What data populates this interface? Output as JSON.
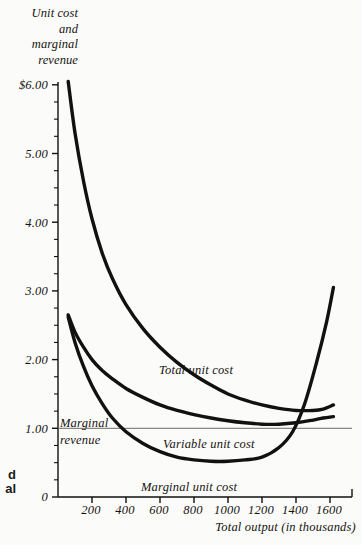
{
  "figure": {
    "y_axis_title": [
      "Unit cost",
      "and",
      "marginal",
      "revenue"
    ],
    "x_axis_title": "Total output (in thousands)",
    "edge_fragment": [
      "d",
      "al"
    ]
  },
  "axes": {
    "y_ticks": [
      "$6.00",
      "5.00",
      "4.00",
      "3.00",
      "2.00",
      "1.00",
      "0"
    ],
    "y_tick_values": [
      6,
      5,
      4,
      3,
      2,
      1,
      0
    ],
    "x_ticks": [
      "200",
      "400",
      "600",
      "800",
      "1000",
      "1200",
      "1400",
      "1600"
    ],
    "x_tick_values": [
      200,
      400,
      600,
      800,
      1000,
      1200,
      1400,
      1600
    ]
  },
  "annotations": {
    "total_unit_cost": "Total unit cost",
    "variable_unit_cost": "Variable unit cost",
    "marginal_unit_cost": "Marginal unit cost",
    "marginal_revenue_line1": "Marginal",
    "marginal_revenue_line2": "revenue"
  },
  "colors": {
    "background": "#fbfbfa",
    "curve": "#111111",
    "axis": "#111111",
    "marginal_revenue_line": "#6e6c66"
  },
  "chart_data": {
    "type": "line",
    "title": "",
    "xlabel": "Total output (in thousands)",
    "ylabel": "Unit cost and marginal revenue",
    "xlim": [
      0,
      1720
    ],
    "ylim": [
      0,
      6.25
    ],
    "grid": false,
    "legend": "inline-labels",
    "x_tick_step": 200,
    "y_tick_step": 1,
    "y_minor_tick_step": 0.25,
    "series": [
      {
        "name": "Total unit cost",
        "label_position": "inline",
        "points": [
          [
            60,
            6.05
          ],
          [
            100,
            5.3
          ],
          [
            150,
            4.6
          ],
          [
            200,
            4.05
          ],
          [
            260,
            3.55
          ],
          [
            320,
            3.18
          ],
          [
            400,
            2.8
          ],
          [
            500,
            2.45
          ],
          [
            600,
            2.18
          ],
          [
            700,
            1.96
          ],
          [
            800,
            1.78
          ],
          [
            900,
            1.63
          ],
          [
            1000,
            1.5
          ],
          [
            1100,
            1.41
          ],
          [
            1200,
            1.34
          ],
          [
            1300,
            1.29
          ],
          [
            1400,
            1.26
          ],
          [
            1500,
            1.26
          ],
          [
            1560,
            1.28
          ],
          [
            1620,
            1.34
          ]
        ]
      },
      {
        "name": "Variable unit cost",
        "label_position": "inline",
        "points": [
          [
            60,
            2.65
          ],
          [
            100,
            2.4
          ],
          [
            150,
            2.18
          ],
          [
            200,
            2.0
          ],
          [
            260,
            1.84
          ],
          [
            320,
            1.72
          ],
          [
            400,
            1.58
          ],
          [
            500,
            1.45
          ],
          [
            600,
            1.34
          ],
          [
            700,
            1.26
          ],
          [
            800,
            1.2
          ],
          [
            900,
            1.15
          ],
          [
            1000,
            1.11
          ],
          [
            1100,
            1.08
          ],
          [
            1200,
            1.06
          ],
          [
            1300,
            1.06
          ],
          [
            1400,
            1.08
          ],
          [
            1500,
            1.12
          ],
          [
            1560,
            1.15
          ],
          [
            1620,
            1.17
          ]
        ]
      },
      {
        "name": "Marginal unit cost",
        "label_position": "inline",
        "points": [
          [
            60,
            2.62
          ],
          [
            100,
            2.25
          ],
          [
            150,
            1.9
          ],
          [
            200,
            1.62
          ],
          [
            260,
            1.36
          ],
          [
            320,
            1.15
          ],
          [
            400,
            0.95
          ],
          [
            500,
            0.78
          ],
          [
            600,
            0.66
          ],
          [
            700,
            0.58
          ],
          [
            800,
            0.54
          ],
          [
            900,
            0.52
          ],
          [
            1000,
            0.52
          ],
          [
            1100,
            0.54
          ],
          [
            1200,
            0.58
          ],
          [
            1300,
            0.72
          ],
          [
            1380,
            0.95
          ],
          [
            1450,
            1.35
          ],
          [
            1520,
            1.95
          ],
          [
            1580,
            2.55
          ],
          [
            1620,
            3.05
          ]
        ]
      },
      {
        "name": "Marginal revenue",
        "style": "thin-horizontal",
        "label_position": "left",
        "points": [
          [
            0,
            1.0
          ],
          [
            1720,
            1.0
          ]
        ],
        "constant_value": 1.0
      }
    ]
  }
}
